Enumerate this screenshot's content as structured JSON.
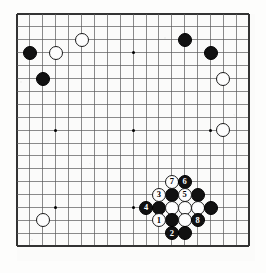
{
  "diagram": {
    "type": "go-board-diagram",
    "board_size": 19,
    "title": "",
    "colors": {
      "black_stone": "#111111",
      "white_stone": "#fdfdfd",
      "grid_line": "#5a5a5a",
      "border_line": "#333333",
      "board_background": "#fbfbfa",
      "page_background": "#ffffff"
    },
    "geometry": {
      "origin_x": 17,
      "origin_y": 14,
      "spacing": 12.9,
      "stone_diameter": 14,
      "board_left": 11,
      "board_top": 8
    },
    "hoshi_points": [
      {
        "col": 3,
        "row": 3
      },
      {
        "col": 9,
        "row": 3
      },
      {
        "col": 15,
        "row": 3
      },
      {
        "col": 3,
        "row": 9
      },
      {
        "col": 9,
        "row": 9
      },
      {
        "col": 15,
        "row": 9
      },
      {
        "col": 3,
        "row": 15
      },
      {
        "col": 9,
        "row": 15
      },
      {
        "col": 15,
        "row": 15
      }
    ],
    "stones": [
      {
        "col": 1,
        "row": 3,
        "color": "black",
        "label": ""
      },
      {
        "col": 3,
        "row": 3,
        "color": "white",
        "label": ""
      },
      {
        "col": 5,
        "row": 2,
        "color": "white",
        "label": ""
      },
      {
        "col": 2,
        "row": 5,
        "color": "black",
        "label": ""
      },
      {
        "col": 13,
        "row": 2,
        "color": "black",
        "label": ""
      },
      {
        "col": 15,
        "row": 3,
        "color": "black",
        "label": ""
      },
      {
        "col": 16,
        "row": 5,
        "color": "white",
        "label": ""
      },
      {
        "col": 16,
        "row": 9,
        "color": "white",
        "label": ""
      },
      {
        "col": 2,
        "row": 16,
        "color": "white",
        "label": ""
      },
      {
        "col": 12,
        "row": 13,
        "color": "white",
        "label": "7"
      },
      {
        "col": 13,
        "row": 13,
        "color": "black",
        "label": "6"
      },
      {
        "col": 11,
        "row": 14,
        "color": "white",
        "label": "3"
      },
      {
        "col": 12,
        "row": 14,
        "color": "black",
        "label": ""
      },
      {
        "col": 13,
        "row": 14,
        "color": "white",
        "label": "5"
      },
      {
        "col": 14,
        "row": 14,
        "color": "black",
        "label": ""
      },
      {
        "col": 10,
        "row": 15,
        "color": "black",
        "label": "4"
      },
      {
        "col": 11,
        "row": 15,
        "color": "black",
        "label": ""
      },
      {
        "col": 12,
        "row": 15,
        "color": "white",
        "label": ""
      },
      {
        "col": 13,
        "row": 15,
        "color": "white",
        "label": ""
      },
      {
        "col": 14,
        "row": 15,
        "color": "white",
        "label": ""
      },
      {
        "col": 15,
        "row": 15,
        "color": "black",
        "label": ""
      },
      {
        "col": 11,
        "row": 16,
        "color": "white",
        "label": "1"
      },
      {
        "col": 12,
        "row": 16,
        "color": "black",
        "label": ""
      },
      {
        "col": 13,
        "row": 16,
        "color": "white",
        "label": ""
      },
      {
        "col": 14,
        "row": 16,
        "color": "black",
        "label": "8"
      },
      {
        "col": 12,
        "row": 17,
        "color": "black",
        "label": "2"
      },
      {
        "col": 13,
        "row": 17,
        "color": "black",
        "label": ""
      }
    ],
    "move_sequence": [
      {
        "number": "1",
        "color": "white",
        "col": 11,
        "row": 16
      },
      {
        "number": "2",
        "color": "black",
        "col": 12,
        "row": 17
      },
      {
        "number": "3",
        "color": "white",
        "col": 11,
        "row": 14
      },
      {
        "number": "4",
        "color": "black",
        "col": 10,
        "row": 15
      },
      {
        "number": "5",
        "color": "white",
        "col": 13,
        "row": 14
      },
      {
        "number": "6",
        "color": "black",
        "col": 13,
        "row": 13
      },
      {
        "number": "7",
        "color": "white",
        "col": 12,
        "row": 13
      },
      {
        "number": "8",
        "color": "black",
        "col": 14,
        "row": 16
      }
    ]
  }
}
